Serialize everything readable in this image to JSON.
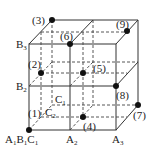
{
  "diagram": {
    "type": "3x3x3 cube orthogonal design grid",
    "axis_labels": {
      "A": [
        "A1",
        "A2",
        "A3"
      ],
      "B": [
        "B1",
        "B2",
        "B3"
      ],
      "C": [
        "C1",
        "C2"
      ]
    },
    "corner_label": {
      "main": "A",
      "s1": "1",
      "b": "B",
      "s2": "1",
      "c": "C",
      "s3": "1"
    },
    "labels": {
      "A2": {
        "main": "A",
        "sub": "2"
      },
      "A3": {
        "main": "A",
        "sub": "3"
      },
      "B2": {
        "main": "B",
        "sub": "2"
      },
      "B3": {
        "main": "B",
        "sub": "3"
      },
      "C1": {
        "main": "C",
        "sub": "1"
      },
      "C2": {
        "main": "C",
        "sub": "2"
      }
    },
    "points": [
      {
        "id": "(1)"
      },
      {
        "id": "(2)"
      },
      {
        "id": "(3)"
      },
      {
        "id": "(4)"
      },
      {
        "id": "(5)"
      },
      {
        "id": "(6)"
      },
      {
        "id": "(7)"
      },
      {
        "id": "(8)"
      },
      {
        "id": "(9)"
      }
    ],
    "colors": {
      "line": "#333333",
      "point": "#111111",
      "background": "#ffffff"
    }
  }
}
